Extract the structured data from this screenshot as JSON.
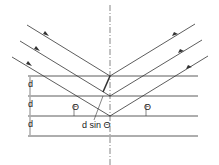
{
  "diagram": {
    "labels": {
      "d1": "d",
      "d2": "d",
      "d3": "d",
      "theta_left": "Θ",
      "theta_right": "Θ",
      "path_difference": "d sin Θ"
    },
    "colors": {
      "line": "#333333",
      "background": "#ffffff"
    }
  }
}
